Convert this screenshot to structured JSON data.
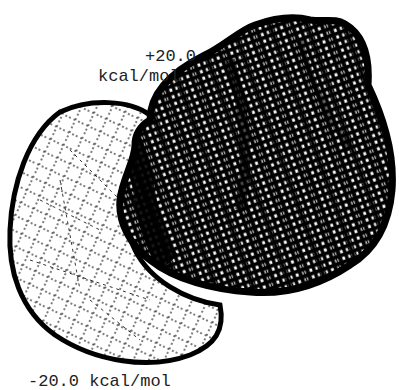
{
  "figure": {
    "labels": {
      "positive_value": "+20.0",
      "positive_unit": "kcal/mol",
      "negative": "-20.0 kcal/mol"
    },
    "surfaces": [
      {
        "name": "positive-potential-surface",
        "shade": "dark",
        "color": "#000000"
      },
      {
        "name": "negative-potential-surface",
        "shade": "light",
        "color": "#ffffff"
      }
    ],
    "colors": {
      "background": "#ffffff",
      "ink": "#000000",
      "text": "#222222"
    }
  }
}
